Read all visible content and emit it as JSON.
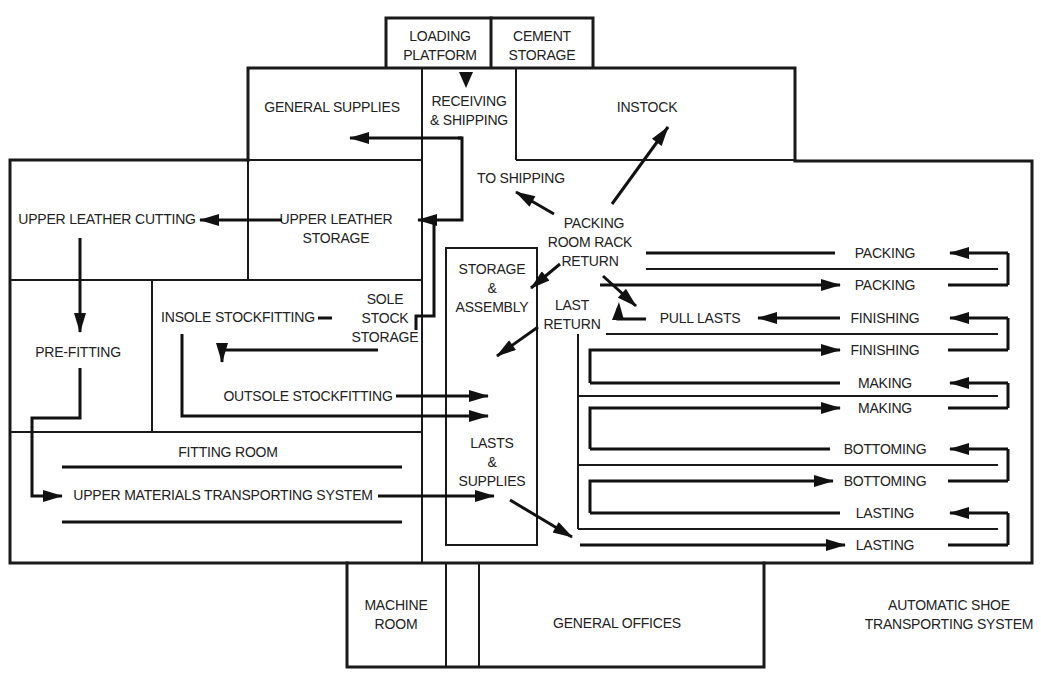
{
  "caption_fragment": "Figure — Factory layout of shoe plant",
  "areas": {
    "loading_platform": [
      "LOADING",
      "PLATFORM"
    ],
    "cement_storage": [
      "CEMENT",
      "STORAGE"
    ],
    "general_supplies": "GENERAL SUPPLIES",
    "receiving_shipping": [
      "RECEIVING",
      "& SHIPPING"
    ],
    "instock": "INSTOCK",
    "to_shipping": "TO SHIPPING",
    "packing_room_rack_return": [
      "PACKING",
      "ROOM RACK",
      "RETURN"
    ],
    "upper_leather_cutting": "UPPER LEATHER CUTTING",
    "upper_leather_storage": [
      "UPPER LEATHER",
      "STORAGE"
    ],
    "storage_assembly": [
      "STORAGE",
      "&",
      "ASSEMBLY"
    ],
    "last_return": [
      "LAST",
      "RETURN"
    ],
    "pull_lasts": "PULL LASTS",
    "pre_fitting": "PRE-FITTING",
    "insole_stockfitting": "INSOLE STOCKFITTING",
    "sole_stock_storage": [
      "SOLE",
      "STOCK",
      "STORAGE"
    ],
    "outsole_stockfitting": "OUTSOLE STOCKFITTING",
    "fitting_room": "FITTING ROOM",
    "upper_materials_transporting": "UPPER MATERIALS TRANSPORTING SYSTEM",
    "lasts_supplies": [
      "LASTS",
      "&",
      "SUPPLIES"
    ],
    "machine_room": [
      "MACHINE",
      "ROOM"
    ],
    "general_offices": "GENERAL OFFICES",
    "automatic_shoe_transporting": [
      "AUTOMATIC SHOE",
      "TRANSPORTING SYSTEM"
    ]
  },
  "conveyor_stations": [
    {
      "label": "PACKING",
      "direction": "in"
    },
    {
      "label": "PACKING",
      "direction": "out"
    },
    {
      "label": "FINISHING",
      "direction": "in"
    },
    {
      "label": "FINISHING",
      "direction": "out"
    },
    {
      "label": "MAKING",
      "direction": "in"
    },
    {
      "label": "MAKING",
      "direction": "out"
    },
    {
      "label": "BOTTOMING",
      "direction": "in"
    },
    {
      "label": "BOTTOMING",
      "direction": "out"
    },
    {
      "label": "LASTING",
      "direction": "in"
    },
    {
      "label": "LASTING",
      "direction": "out"
    }
  ]
}
